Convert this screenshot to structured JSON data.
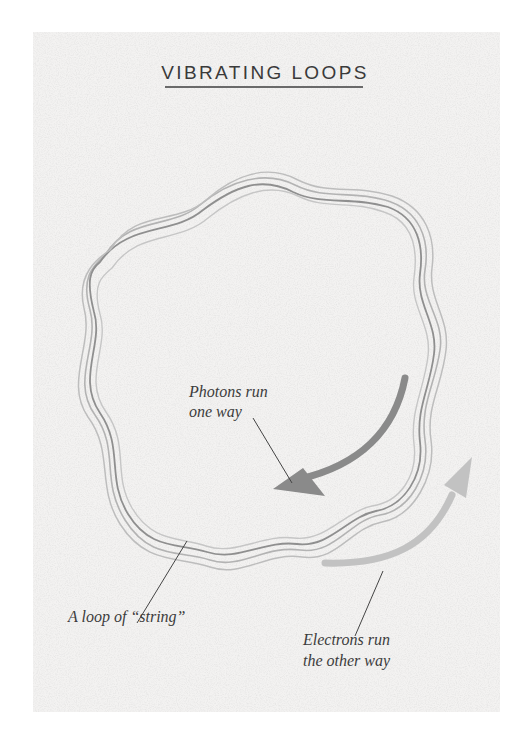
{
  "title": "VIBRATING LOOPS",
  "labels": {
    "photons_line1": "Photons run",
    "photons_line2": "one way",
    "loop": "A loop of “string”",
    "electrons_line1": "Electrons run",
    "electrons_line2": "the other way"
  },
  "colors": {
    "background": "#ffffff",
    "panel": "#f3f2f1",
    "loop_strokes": [
      "#a9a9a9",
      "#8f8f8f",
      "#b9b9b9",
      "#c4c4c4"
    ],
    "photon_arrow": "#8a8a8a",
    "electron_arrow": "#c2c2c2",
    "leader_lines": "#444444",
    "text": "#3a3a3a"
  },
  "arrows": [
    {
      "name": "photon-arrow",
      "direction": "clockwise (downward-left)"
    },
    {
      "name": "electron-arrow",
      "direction": "counter-clockwise (upward-right)"
    }
  ]
}
